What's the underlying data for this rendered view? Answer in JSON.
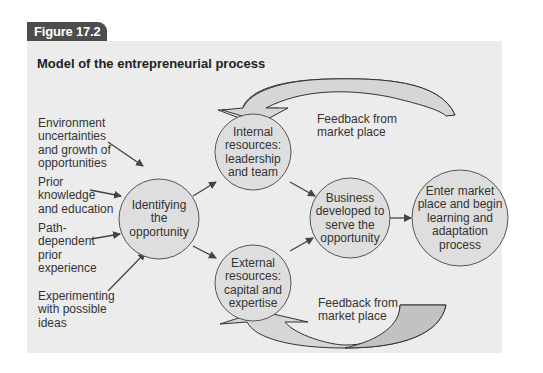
{
  "figure": {
    "tab_label": "Figure 17.2",
    "title": "Model of the entrepreneurial process"
  },
  "colors": {
    "tab_bg": "#4d4d4d",
    "panel_bg": "#ececec",
    "circle_fill": "#dcdcdc",
    "arrow_fill": "#c8c8c8",
    "stroke": "#444444"
  },
  "inputs": [
    {
      "id": "env",
      "text": "Environment\nuncertainties\nand growth of\nopportunities"
    },
    {
      "id": "prior",
      "text": "Prior\nknowledge\nand education"
    },
    {
      "id": "path",
      "text": "Path-\ndependent\nprior\nexperience"
    },
    {
      "id": "experiment",
      "text": "Experimenting\nwith possible\nideas"
    }
  ],
  "nodes": [
    {
      "id": "identify",
      "text": "Identifying\nthe\nopportunity"
    },
    {
      "id": "internal",
      "text": "Internal\nresources:\nleadership\nand team"
    },
    {
      "id": "external",
      "text": "External\nresources:\ncapital and\nexpertise"
    },
    {
      "id": "business",
      "text": "Business\ndeveloped to\nserve the\nopportunity"
    },
    {
      "id": "market",
      "text": "Enter market\nplace and begin\nlearning and\nadaptation\nprocess"
    }
  ],
  "feedback": {
    "top": "Feedback from\nmarket place",
    "bottom": "Feedback from\nmarket place"
  }
}
